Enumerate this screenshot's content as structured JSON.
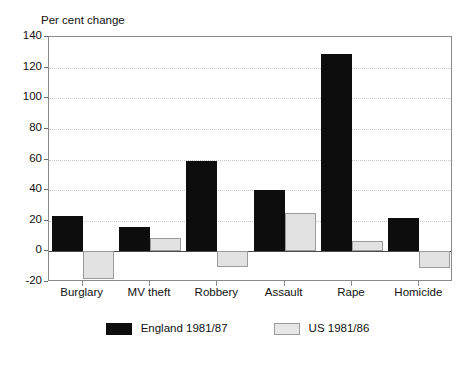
{
  "chart_data": {
    "type": "bar",
    "title": "",
    "ylabel": "Per cent change",
    "xlabel": "",
    "categories": [
      "Burglary",
      "MV theft",
      "Robbery",
      "Assault",
      "Rape",
      "Homicide"
    ],
    "series": [
      {
        "name": "England 1981/87",
        "color": "#0d0d0d",
        "values": [
          23,
          16,
          59,
          40,
          129,
          22
        ]
      },
      {
        "name": "US 1981/86",
        "color": "#e2e2e2",
        "values": [
          -18,
          9,
          -10,
          25,
          7,
          -11
        ]
      }
    ],
    "ylim": [
      -20,
      140
    ],
    "ytick_values": [
      -20,
      0,
      20,
      40,
      60,
      80,
      100,
      120,
      140
    ],
    "ytick_labels": [
      "-20",
      "0",
      "20",
      "40",
      "60",
      "80",
      "100",
      "120",
      "140"
    ],
    "grid": true,
    "legend_position": "bottom"
  }
}
